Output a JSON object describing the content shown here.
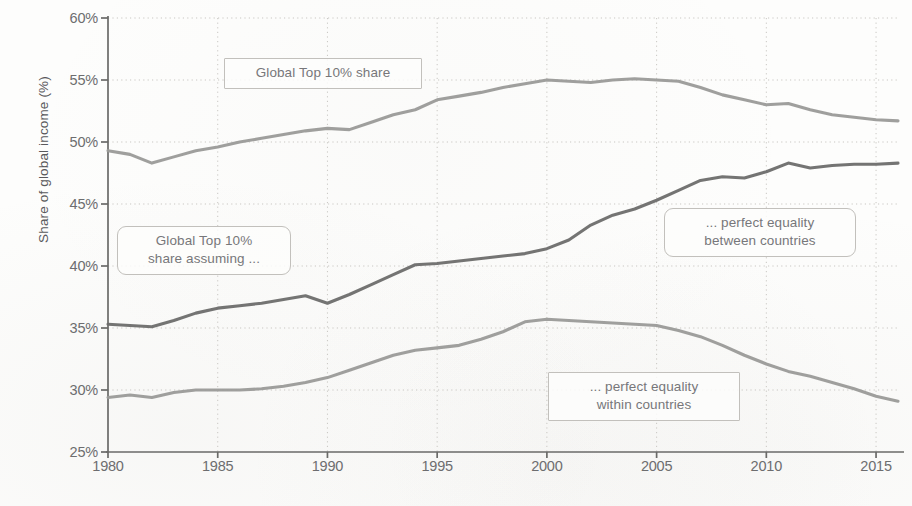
{
  "chart_data": {
    "type": "line",
    "title": "",
    "xlabel": "",
    "ylabel": "Share of global income (%)",
    "xlim": [
      1980,
      2016
    ],
    "ylim": [
      25,
      60
    ],
    "grid": true,
    "legend_position": "inline-callouts",
    "y_tick_labels": [
      "60%",
      "55%",
      "50%",
      "45%",
      "40%",
      "35%",
      "30%",
      "25%"
    ],
    "y_ticks": [
      60,
      55,
      50,
      45,
      40,
      35,
      30,
      25
    ],
    "x_tick_labels": [
      "1980",
      "1985",
      "1990",
      "1995",
      "2000",
      "2005",
      "2010",
      "2015"
    ],
    "x_ticks": [
      1980,
      1985,
      1990,
      1995,
      2000,
      2005,
      2010,
      2015
    ],
    "x": [
      1980,
      1981,
      1982,
      1983,
      1984,
      1985,
      1986,
      1987,
      1988,
      1989,
      1990,
      1991,
      1992,
      1993,
      1994,
      1995,
      1996,
      1997,
      1998,
      1999,
      2000,
      2001,
      2002,
      2003,
      2004,
      2005,
      2006,
      2007,
      2008,
      2009,
      2010,
      2011,
      2012,
      2013,
      2014,
      2015,
      2016
    ],
    "series": [
      {
        "name": "Global Top 10% share",
        "color": "#9a9a98",
        "values": [
          49.3,
          49.0,
          48.3,
          48.8,
          49.3,
          49.6,
          50.0,
          50.3,
          50.6,
          50.9,
          51.1,
          51.0,
          51.6,
          52.2,
          52.6,
          53.4,
          53.7,
          54.0,
          54.4,
          54.7,
          55.0,
          54.9,
          54.8,
          55.0,
          55.1,
          55.0,
          54.9,
          54.4,
          53.8,
          53.4,
          53.0,
          53.1,
          52.6,
          52.2,
          52.0,
          51.8,
          51.7
        ]
      },
      {
        "name": "Global Top 10% share assuming ... perfect equality between countries",
        "color": "#6d6d6b",
        "values": [
          35.3,
          35.2,
          35.1,
          35.6,
          36.2,
          36.6,
          36.8,
          37.0,
          37.3,
          37.6,
          37.0,
          37.7,
          38.5,
          39.3,
          40.1,
          40.2,
          40.4,
          40.6,
          40.8,
          41.0,
          41.4,
          42.1,
          43.3,
          44.1,
          44.6,
          45.3,
          46.1,
          46.9,
          47.2,
          47.1,
          47.6,
          48.3,
          47.9,
          48.1,
          48.2,
          48.2,
          48.3
        ]
      },
      {
        "name": "Global Top 10% share assuming ... perfect equality within countries",
        "color": "#9a9a98",
        "values": [
          29.4,
          29.6,
          29.4,
          29.8,
          30.0,
          30.0,
          30.0,
          30.1,
          30.3,
          30.6,
          31.0,
          31.6,
          32.2,
          32.8,
          33.2,
          33.4,
          33.6,
          34.1,
          34.7,
          35.5,
          35.7,
          35.6,
          35.5,
          35.4,
          35.3,
          35.2,
          34.8,
          34.3,
          33.6,
          32.8,
          32.1,
          31.5,
          31.1,
          30.6,
          30.1,
          29.5,
          29.1
        ]
      }
    ],
    "annotations": [
      {
        "id": "callout-top-share",
        "text": "Global Top 10% share",
        "shape": "square"
      },
      {
        "id": "callout-assuming",
        "text": "Global Top 10%\nshare assuming ...",
        "shape": "rounded"
      },
      {
        "id": "callout-between-countries",
        "text": "... perfect equality\nbetween countries",
        "shape": "rounded"
      },
      {
        "id": "callout-within-countries",
        "text": "... perfect equality\nwithin countries",
        "shape": "square"
      }
    ]
  },
  "axis_colors": {
    "axis_line": "#6a6a68",
    "grid_line": "#c9c7c3",
    "tick_text": "#6d6d6f"
  }
}
